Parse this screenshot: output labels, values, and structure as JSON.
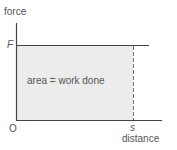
{
  "diagram": {
    "y_axis_label": "force",
    "x_axis_label": "distance",
    "force_marker": "F",
    "distance_marker": "s",
    "origin_label": "O",
    "area_label": "area = work done",
    "colors": {
      "axis": "#444444",
      "area_fill": "#ececec",
      "dashed_line": "#777777",
      "text": "#555555"
    }
  }
}
